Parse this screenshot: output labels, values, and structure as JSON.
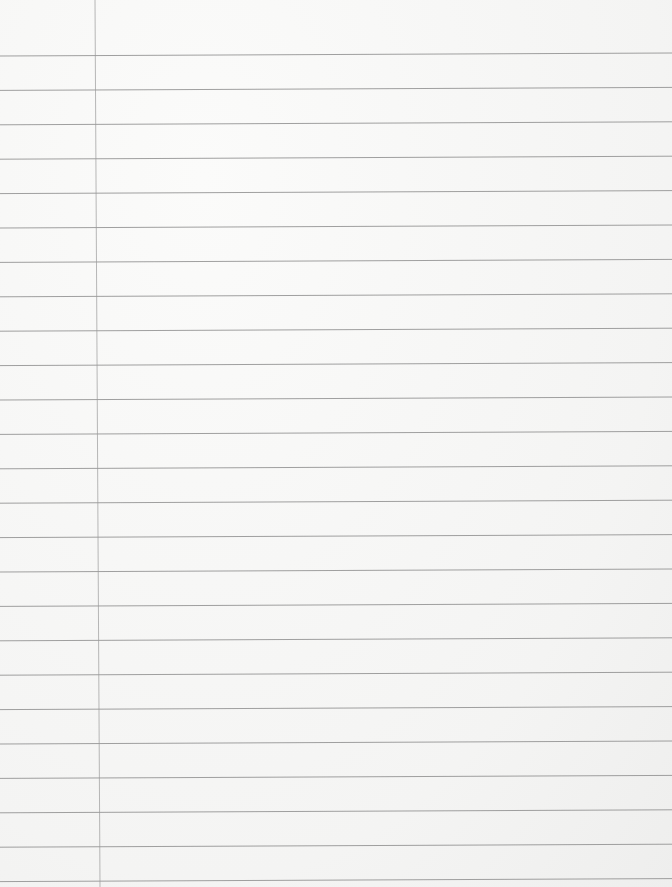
{
  "paper": {
    "type": "ruled notebook paper",
    "content": "",
    "rule_count": 25,
    "has_margin_line": true,
    "colors": {
      "background": "#f7f7f6",
      "rule": "#8f8f8f",
      "margin": "#9a9a9a"
    }
  }
}
